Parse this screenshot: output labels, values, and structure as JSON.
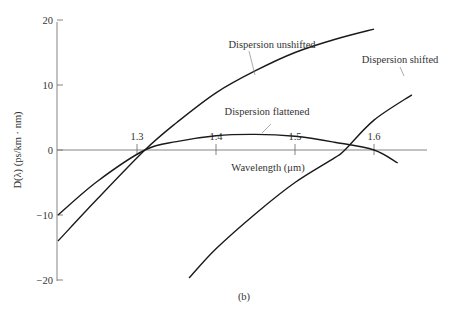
{
  "chart_data": {
    "type": "line",
    "title": "",
    "caption": "(b)",
    "xlabel": "Wavelength (μm)",
    "ylabel": "D(λ) (ps/km · nm)",
    "xlim": [
      1.2,
      1.64
    ],
    "ylim": [
      -20,
      20
    ],
    "xticks": [
      1.3,
      1.4,
      1.5,
      1.6
    ],
    "xtick_labels": [
      "1.3",
      "1.4",
      "1.5",
      "1.6"
    ],
    "yticks": [
      20,
      10,
      0,
      -10,
      -20
    ],
    "ytick_labels": [
      "20",
      "10",
      "0",
      "−10",
      "−20"
    ],
    "grid": false,
    "legend": "none (curves annotated directly)",
    "series": [
      {
        "name": "Dispersion unshifted",
        "x": [
          1.2,
          1.25,
          1.31,
          1.35,
          1.4,
          1.45,
          1.5,
          1.55,
          1.6
        ],
        "y": [
          -14,
          -7.5,
          0,
          4.2,
          8.8,
          12.2,
          15,
          17,
          18.6
        ]
      },
      {
        "name": "Dispersion flattened",
        "x": [
          1.2,
          1.25,
          1.31,
          1.35,
          1.4,
          1.45,
          1.5,
          1.55,
          1.6,
          1.63
        ],
        "y": [
          -10,
          -4.8,
          0,
          1.3,
          2.2,
          2.4,
          2.1,
          1.2,
          0,
          -2
        ]
      },
      {
        "name": "Dispersion shifted",
        "x": [
          1.366,
          1.4,
          1.45,
          1.5,
          1.55,
          1.563,
          1.6,
          1.648
        ],
        "y": [
          -19.7,
          -15.2,
          -9.8,
          -5,
          -1.2,
          0,
          4.6,
          8.5
        ]
      }
    ],
    "annotations": [
      {
        "text": "Dispersion unshifted",
        "points_to": "Dispersion unshifted"
      },
      {
        "text": "Dispersion flattened",
        "points_to": "Dispersion flattened"
      },
      {
        "text": "Dispersion shifted",
        "points_to": "Dispersion shifted"
      }
    ]
  }
}
